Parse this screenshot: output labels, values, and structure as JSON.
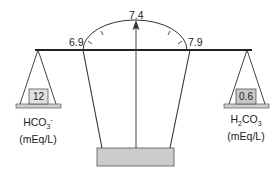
{
  "diagram": {
    "type": "acid-base balance scale",
    "gauge": {
      "left_label": "6.9",
      "center_label": "7.4",
      "right_label": "7.9",
      "pointer_value": "7.4"
    },
    "left_pan": {
      "value": "12",
      "species_main": "HCO",
      "species_sub": "3",
      "species_sup": "-",
      "unit": "(mEq/L)"
    },
    "right_pan": {
      "value": "0.6",
      "species_prefix": "H",
      "species_prefix_sub": "2",
      "species_main": "CO",
      "species_sub": "3",
      "unit": "(mEq/L)"
    },
    "colors": {
      "line": "#222222",
      "box_light": "#e0e0e0",
      "box_dark": "#c8c8c8",
      "pan": "#cfcfcf",
      "base": "#cccccc"
    }
  }
}
